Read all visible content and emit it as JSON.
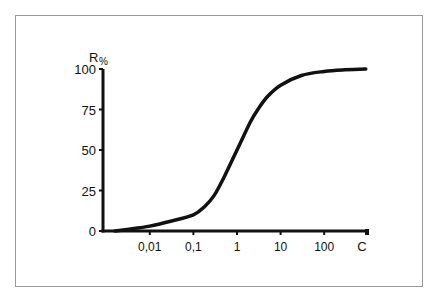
{
  "chart_data": {
    "type": "line",
    "title": "",
    "xlabel": "C",
    "ylabel": "R",
    "ylabel_unit": "%",
    "x_scale": "log",
    "x_ticks": [
      0.01,
      0.1,
      1,
      10,
      100
    ],
    "x_tick_labels": [
      "0,01",
      "0,1",
      "1",
      "10",
      "100"
    ],
    "y_ticks": [
      0,
      25,
      50,
      75,
      100
    ],
    "y_tick_labels": [
      "0",
      "25",
      "50",
      "75",
      "100"
    ],
    "xlim": [
      0.001,
      1000
    ],
    "ylim": [
      0,
      100
    ],
    "grid": false,
    "legend": "none",
    "series": [
      {
        "name": "R",
        "x": [
          0.0016,
          0.003,
          0.01,
          0.03,
          0.1,
          0.18,
          0.3,
          0.5,
          1,
          2,
          3,
          5,
          10,
          30,
          100,
          300,
          900
        ],
        "y": [
          0,
          1,
          3,
          6,
          10,
          15,
          22,
          33,
          50,
          67,
          75,
          83,
          90,
          96,
          98.5,
          99.5,
          100
        ]
      }
    ],
    "colors": {
      "line": "#111111",
      "axis": "#111111",
      "frame": "#9a9a9a"
    }
  }
}
